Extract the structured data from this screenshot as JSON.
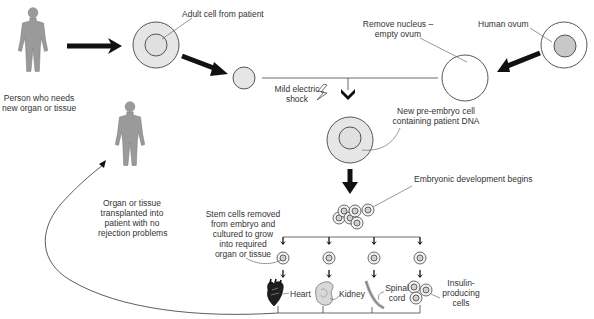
{
  "diagram": {
    "labels": {
      "person_needs": [
        "Person who needs",
        "new organ or tissue"
      ],
      "adult_cell": "Adult cell from patient",
      "remove_nucleus": [
        "Remove nucleus –",
        "empty ovum"
      ],
      "human_ovum": "Human ovum",
      "mild_shock": [
        "Mild electric",
        "shock"
      ],
      "new_pre_embryo": [
        "New pre-embryo cell",
        "containing patient DNA"
      ],
      "embryonic_dev": "Embryonic development begins",
      "stem_cells": [
        "Stem cells removed",
        "from embryo and",
        "cultured to grow",
        "into required",
        "organ or tissue"
      ],
      "transplanted": [
        "Organ or tissue",
        "transplanted into",
        "patient with no",
        "rejection problems"
      ],
      "heart": "Heart",
      "kidney": "Kidney",
      "spinal_cord": [
        "Spinal",
        "cord"
      ],
      "insulin": [
        "Insulin-",
        "producing",
        "cells"
      ]
    },
    "colors": {
      "cell_fill": "#e6e6e6",
      "nucleus_fill": "#c8c8c8",
      "figure_fill": "#9a9a9a",
      "arrow": "#111111",
      "line": "#444444"
    },
    "icons": [
      "person-figure-icon",
      "cell-icon",
      "lightning-bolt-icon",
      "heart-icon",
      "kidney-icon",
      "spinal-cord-icon"
    ]
  }
}
